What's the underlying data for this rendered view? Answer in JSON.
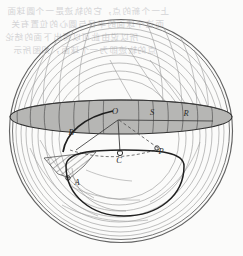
{
  "figure": {
    "background_color": "#fbfbfa",
    "ink_color": "#3a3a3a",
    "band_fill_color": "#b6b6b4",
    "ghost_text_color": "#c9c9cc",
    "labels": [
      {
        "id": "label-O",
        "text": "O",
        "x": 115,
        "y": 114
      },
      {
        "id": "label-S",
        "text": "S",
        "x": 152,
        "y": 115
      },
      {
        "id": "label-R",
        "text": "R",
        "x": 186,
        "y": 116
      },
      {
        "id": "label-B",
        "text": "B",
        "x": 71,
        "y": 135
      },
      {
        "id": "label-C",
        "text": "C",
        "x": 119,
        "y": 160
      },
      {
        "id": "label-P",
        "text": "P",
        "x": 159,
        "y": 154
      },
      {
        "id": "label-A",
        "text": "A",
        "x": 75,
        "y": 184
      }
    ],
    "ghost_text": {
      "line1": "上一个新的点，它的轨迹是一个圆球面",
      "line2": "而这个球面的半径与圆心的位置有关",
      "line3": "所以说由此可以得出下面的结论",
      "line4": "点的轨迹即为一个球面，如图所示"
    },
    "geometry": {
      "circle_center_x": 121,
      "circle_center_y": 131,
      "circle_radius": 112,
      "band_center_y": 117,
      "band_rx": 111,
      "band_ry": 17
    }
  }
}
